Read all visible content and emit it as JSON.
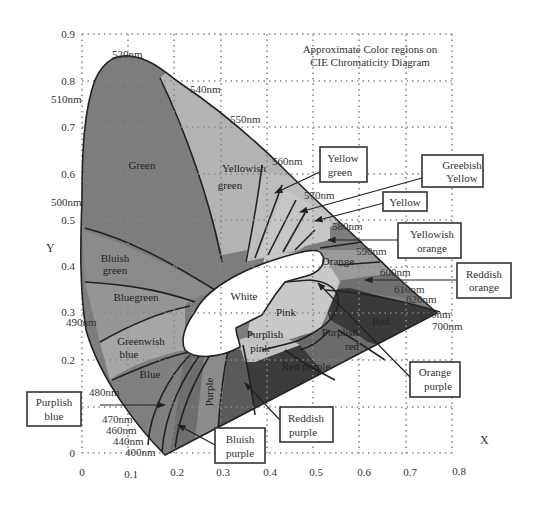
{
  "title": {
    "line1": "Approximate Color regions on",
    "line2": "CIE Chromaticity Diagram"
  },
  "axes": {
    "xlabel": "X",
    "ylabel": "Y",
    "xticks": [
      "0",
      "0.1",
      "0.2",
      "0.3",
      "0.4",
      "0.5",
      "0.6",
      "0.7",
      "0.8"
    ],
    "yticks": [
      "0",
      "0.2",
      "0.3",
      "0.4",
      "0.5",
      "0.6",
      "0.7",
      "0.8",
      "0.9"
    ]
  },
  "wavelengths": {
    "w400": "400nm",
    "w440": "440nm",
    "w460": "460nm",
    "w470": "470nm",
    "w480": "480nm",
    "w490": "490nm",
    "w500": "500nm",
    "w510": "510nm",
    "w520": "520nm",
    "w540": "540nm",
    "w550": "550nm",
    "w560": "560nm",
    "w570": "570nm",
    "w580": "580nm",
    "w590": "590nm",
    "w600": "600nm",
    "w610": "610nm",
    "w620": "620nm",
    "w640": "640nm",
    "w700": "700nm"
  },
  "regions": {
    "green": "Green",
    "yellowish_green_1": "Yellowish",
    "yellowish_green_2": "green",
    "bluish_green_1": "Bluish",
    "bluish_green_2": "green",
    "bluegreen": "Bluegreen",
    "greenish_blue_1": "Greenwish",
    "greenish_blue_2": "blue",
    "blue": "Blue",
    "purple": "Purple",
    "white": "White",
    "pink": "Pink",
    "purplish_pink_1": "Purplish",
    "purplish_pink_2": "pink",
    "purplish_red_1": "Purplish",
    "purplish_red_2": "red",
    "red_purple": "Red purple",
    "red": "Red",
    "orange": "Orange"
  },
  "callouts": {
    "yellow_green": [
      "Yellow",
      "green"
    ],
    "greenish_yellow": [
      "Greebish",
      "Yellow"
    ],
    "yellow": [
      "Yellow"
    ],
    "yellowish_orange": [
      "Yellowish",
      "orange"
    ],
    "reddish_orange": [
      "Reddish",
      "orange"
    ],
    "orange_purple": [
      "Orange",
      "purple"
    ],
    "reddish_purple": [
      "Reddish",
      "purple"
    ],
    "bluish_purple": [
      "Bluish",
      "purple"
    ],
    "purplish_blue": [
      "Purplish",
      "blue"
    ]
  },
  "colors": {
    "green": "#7d7d7d",
    "yellowish_green": "#b3b3b3",
    "yellow_band": "#c4c4c4",
    "bluish_green": "#8a8a8a",
    "bluegreen": "#969696",
    "greenish_blue": "#a6a6a6",
    "blue": "#7f7f7f",
    "purple_bands": "#6e6e6e",
    "purple": "#8c8c8c",
    "red_purple": "#3c3c3c",
    "purplish_red": "#6b6b6b",
    "red": "#3a3a3a",
    "orange": "#9a9a9a",
    "reddish_orange": "#707070",
    "pink": "#c8c8c8",
    "white": "#ffffff"
  }
}
